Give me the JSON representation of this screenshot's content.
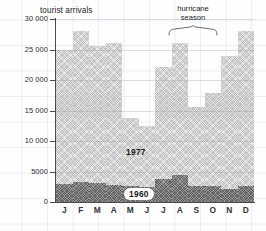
{
  "chart_data": {
    "type": "bar",
    "title": "tourist arrivals",
    "xlabel": "",
    "ylabel": "tourist arrivals",
    "ylim": [
      0,
      30000
    ],
    "yticks": [
      0,
      5000,
      10000,
      15000,
      20000,
      25000,
      30000
    ],
    "ytick_labels": [
      "0",
      "5000",
      "10 000",
      "15 000",
      "20 000",
      "25 000",
      "30 000"
    ],
    "grid": true,
    "legend_position": "inline-annotation",
    "categories": [
      "J",
      "F",
      "M",
      "A",
      "M",
      "J",
      "J",
      "A",
      "S",
      "O",
      "N",
      "D"
    ],
    "series": [
      {
        "name": "1977",
        "values": [
          25000,
          28000,
          25600,
          26000,
          13700,
          12500,
          22200,
          26000,
          15500,
          17800,
          24000,
          28000
        ]
      },
      {
        "name": "1960",
        "values": [
          2950,
          3350,
          3050,
          2750,
          2600,
          2400,
          3800,
          4500,
          2600,
          2700,
          2200,
          2650
        ]
      }
    ],
    "annotations": [
      {
        "text": "hurricane season",
        "line1": "hurricane",
        "line2": "season",
        "spans": [
          "S",
          "O",
          "N"
        ]
      },
      {
        "text": "1977",
        "series": "1977"
      },
      {
        "text": "1960",
        "series": "1960"
      }
    ]
  },
  "labels": {
    "title": "tourist arrivals",
    "series_1977": "1977",
    "series_1960": "1960",
    "hurricane_line1": "hurricane",
    "hurricane_line2": "season"
  },
  "colors": {
    "axis": "#4a4a4a",
    "bar_1977": "#e9e9e9",
    "bar_1960": "#9b9b9b",
    "grid": "#b8c0d4",
    "text": "#222222"
  }
}
